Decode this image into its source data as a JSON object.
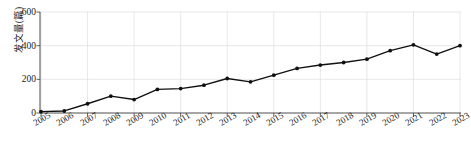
{
  "chart_data": {
    "type": "line",
    "title": "",
    "xlabel": "",
    "ylabel": "发文量(篇)",
    "categories": [
      "2005",
      "2006",
      "2007",
      "2008",
      "2009",
      "2010",
      "2011",
      "2012",
      "2013",
      "2014",
      "2015",
      "2016",
      "2017",
      "2018",
      "2019",
      "2020",
      "2021",
      "2022",
      "2023"
    ],
    "values": [
      8,
      12,
      55,
      100,
      80,
      140,
      145,
      165,
      205,
      185,
      225,
      265,
      285,
      300,
      320,
      370,
      405,
      350,
      400
    ],
    "series": [
      {
        "name": "发文量",
        "values": [
          8,
          12,
          55,
          100,
          80,
          140,
          145,
          165,
          205,
          185,
          225,
          265,
          285,
          300,
          320,
          370,
          405,
          350,
          400
        ]
      }
    ],
    "ylim": [
      0,
      600
    ],
    "yticks": [
      0,
      200,
      400,
      600
    ],
    "ytick_labels": [
      "0",
      "200",
      "400",
      "600"
    ],
    "grid": true,
    "grid_axis": "both",
    "legend": false,
    "legend_position": "none",
    "marker": "circle",
    "line_color": "#111111",
    "grid_color": "#d8d8d8",
    "axis_color": "#3a3a3a",
    "background_color": "#ffffff",
    "xtick_rotation": -30
  },
  "axis": {
    "y_title": "发文量(篇)",
    "y_ticks": [
      "600",
      "400",
      "200",
      "0"
    ]
  }
}
